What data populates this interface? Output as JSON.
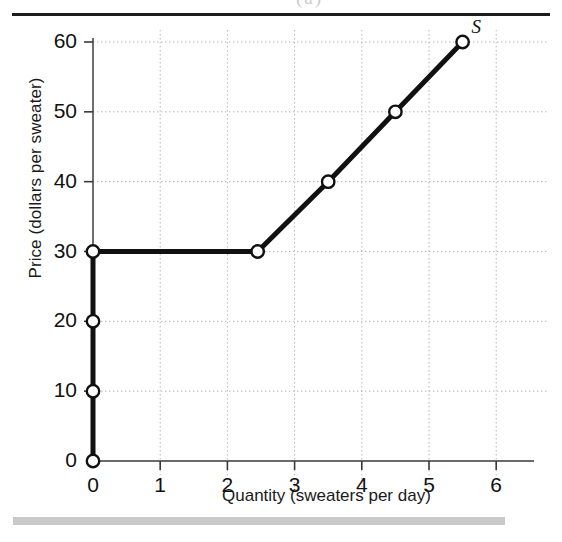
{
  "figure": {
    "top_rule": true,
    "bottom_bar": true,
    "crop_remnant_text": "(a)"
  },
  "chart_data": {
    "type": "line",
    "title": "",
    "subtitle": "",
    "xlabel": "Quantity (sweaters per day)",
    "ylabel": "Price (dollars per sweater)",
    "xlim": [
      0,
      6.5
    ],
    "ylim": [
      0,
      63
    ],
    "xticks": [
      0,
      1,
      2,
      3,
      4,
      5,
      6
    ],
    "xticklabels": [
      "0",
      "1",
      "2",
      "3",
      "4",
      "5",
      "6"
    ],
    "yticks": [
      0,
      10,
      20,
      30,
      40,
      50,
      60
    ],
    "yticklabels": [
      "0",
      "10",
      "20",
      "30",
      "40",
      "50",
      "60"
    ],
    "grid": true,
    "grid_style": "dotted",
    "grid_color": "#b4b4b4",
    "legend": "none",
    "series": [
      {
        "name": "S",
        "label": "S",
        "label_style": "italic",
        "color": "#111111",
        "linewidth": 5,
        "marker": "open-circle",
        "points": [
          {
            "x": 0,
            "y": 0
          },
          {
            "x": 0,
            "y": 10
          },
          {
            "x": 0,
            "y": 20
          },
          {
            "x": 0,
            "y": 30
          },
          {
            "x": 2.45,
            "y": 30
          },
          {
            "x": 3.5,
            "y": 40
          },
          {
            "x": 4.5,
            "y": 50
          },
          {
            "x": 5.5,
            "y": 60
          }
        ],
        "marked_points": [
          {
            "x": 0,
            "y": 0
          },
          {
            "x": 0,
            "y": 10
          },
          {
            "x": 0,
            "y": 20
          },
          {
            "x": 0,
            "y": 30
          },
          {
            "x": 2.45,
            "y": 30
          },
          {
            "x": 3.5,
            "y": 40
          },
          {
            "x": 4.5,
            "y": 50
          },
          {
            "x": 5.5,
            "y": 60
          }
        ]
      }
    ],
    "annotations": [
      {
        "text": "S",
        "x": 5.75,
        "y": 61.5,
        "style": "italic"
      }
    ]
  }
}
